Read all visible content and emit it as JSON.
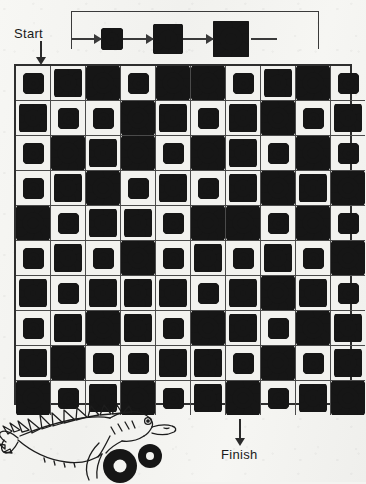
{
  "puzzle": {
    "start_label": "Start",
    "finish_label": "Finish",
    "paper_color": "#f4f4f1",
    "ink_color": "#161616"
  },
  "legend": {
    "description": "gear size cycle: small to medium to large and repeat",
    "sequence": [
      "small-gear",
      "medium-gear",
      "large-gear"
    ],
    "arrow_icon": "arrow-right-icon",
    "loop_icon": "loop-return-icon"
  },
  "gear_sizes": {
    "small": {
      "name": "small-gear",
      "teeth": 8,
      "outer_radius": 9,
      "hole_radius": 2
    },
    "medium": {
      "name": "medium-gear",
      "teeth": 10,
      "outer_radius": 13,
      "hole_radius": 3
    },
    "large": {
      "name": "large-gear",
      "teeth": 10,
      "outer_radius": 16,
      "hole_radius": 6
    }
  },
  "grid": {
    "columns": 10,
    "rows": 10,
    "start_column": 1,
    "finish_column": 7,
    "cells": [
      [
        "S",
        "M",
        "L",
        "S",
        "L",
        "L",
        "S",
        "M",
        "L",
        "S"
      ],
      [
        "M",
        "S",
        "S",
        "L",
        "M",
        "S",
        "M",
        "L",
        "S",
        "M"
      ],
      [
        "S",
        "L",
        "M",
        "L",
        "S",
        "L",
        "M",
        "S",
        "L",
        "S"
      ],
      [
        "S",
        "M",
        "L",
        "S",
        "M",
        "S",
        "M",
        "L",
        "M",
        "L"
      ],
      [
        "L",
        "S",
        "M",
        "M",
        "S",
        "L",
        "L",
        "S",
        "L",
        "S"
      ],
      [
        "S",
        "M",
        "S",
        "L",
        "S",
        "M",
        "S",
        "M",
        "S",
        "L"
      ],
      [
        "M",
        "S",
        "M",
        "M",
        "M",
        "S",
        "M",
        "L",
        "M",
        "S"
      ],
      [
        "S",
        "M",
        "L",
        "M",
        "S",
        "L",
        "M",
        "S",
        "L",
        "M"
      ],
      [
        "M",
        "L",
        "S",
        "S",
        "M",
        "M",
        "S",
        "L",
        "S",
        "M"
      ],
      [
        "L",
        "S",
        "M",
        "L",
        "S",
        "M",
        "L",
        "S",
        "M",
        "L"
      ]
    ]
  },
  "illustration": {
    "name": "stegosaurus-with-gears",
    "description": "line-drawn spiked dinosaur holding gears at bottom left"
  }
}
